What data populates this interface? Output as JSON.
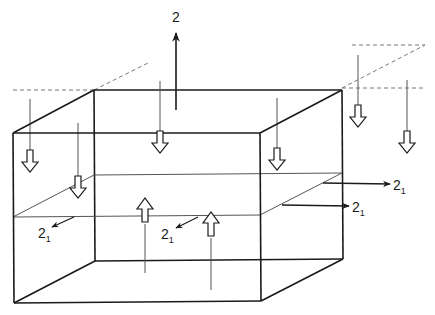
{
  "diagram": {
    "type": "3D box with field/flux arrows",
    "colors": {
      "stroke": "#1a1a1a",
      "thin": "#555555",
      "dash": "#777777",
      "background": "#ffffff"
    },
    "labels": {
      "top_arrow": "2",
      "right_upper": "2",
      "right_upper_sub": "1",
      "right_lower": "2",
      "right_lower_sub": "1",
      "left_inner": "2",
      "left_inner_sub": "1",
      "center_inner": "2",
      "center_inner_sub": "1"
    },
    "down_arrows_count": 6,
    "up_arrows_count": 2
  }
}
